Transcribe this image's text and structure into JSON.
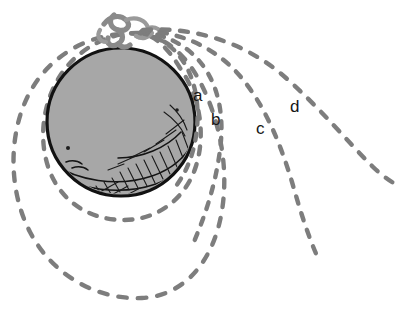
{
  "figure": {
    "background_color": "#ffffff"
  },
  "colors": {
    "earth_fill": "#a7a7a7",
    "earth_outline": "#121212",
    "trajectory": "#7d7d7d",
    "mountain": "#8a8a8a",
    "hatching": "#141414",
    "label_text": "#161616"
  },
  "earth": {
    "name": "earth-sphere",
    "center_x": 121,
    "center_y": 122,
    "radius": 74
  },
  "mountain": {
    "name": "mountain-peak",
    "x": 122,
    "y": 30
  },
  "labels": [
    {
      "id": "a",
      "text": "a",
      "x": 193,
      "y": 87,
      "trajectory": "sub-orbital-short"
    },
    {
      "id": "b",
      "text": "b",
      "x": 211,
      "y": 111,
      "trajectory": "sub-orbital-medium"
    },
    {
      "id": "c",
      "text": "c",
      "x": 256,
      "y": 120,
      "trajectory": "sub-orbital-long"
    },
    {
      "id": "d",
      "text": "d",
      "x": 290,
      "y": 98,
      "trajectory": "escape-path"
    }
  ],
  "trajectories": [
    {
      "id": "a",
      "name": "trajectory-a",
      "label": "a",
      "kind": "ballistic",
      "note": "shortest throw, falls back to surface nearest the peak"
    },
    {
      "id": "b",
      "name": "trajectory-b",
      "label": "b",
      "kind": "ballistic",
      "note": "medium throw"
    },
    {
      "id": "c",
      "name": "trajectory-c",
      "label": "c",
      "kind": "ballistic",
      "note": "long throw"
    },
    {
      "id": "d",
      "name": "trajectory-d",
      "label": "d",
      "kind": "ballistic",
      "note": "longest throw, leaves the frame"
    }
  ],
  "orbits": [
    {
      "id": "circular",
      "name": "orbit-circular",
      "kind": "closed-circular",
      "note": "dashed circle hugging the sphere"
    },
    {
      "id": "elliptical",
      "name": "orbit-elliptical",
      "kind": "closed-elliptical",
      "note": "larger dashed ellipse around the sphere"
    }
  ]
}
